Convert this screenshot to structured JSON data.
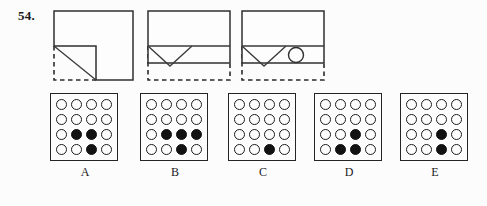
{
  "question": {
    "number": "54."
  },
  "colors": {
    "ink": "#1c1c1c",
    "fill": "#121212",
    "paper": "#fcfcfc",
    "fold_line": "#3a3a3a",
    "dashed_edge": "#2b2b2b"
  },
  "fold_sequence": {
    "name": "paper-folding-sequence",
    "panels": [
      {
        "id": "fold-step-1",
        "description": "square-sheet-bottom-left-corner-folded-up-diagonally",
        "solid_shape": "square",
        "dashed_shape": "original-corner-outline",
        "fold_line": "diagonal"
      },
      {
        "id": "fold-step-2",
        "description": "bottom-edge-folded-up-revealing-v-shaped-flap",
        "solid_shape": "rectangle",
        "dashed_shape": "original-bottom-outline",
        "fold_line": "horizontal-and-v"
      },
      {
        "id": "fold-step-3",
        "description": "hole-punched-through-folded-paper",
        "solid_shape": "rectangle",
        "dashed_shape": "original-bottom-outline",
        "punch": "single-round-hole"
      }
    ]
  },
  "answer_options": [
    {
      "label": "A",
      "name": "option-a",
      "grid": [
        [
          0,
          0,
          0,
          0
        ],
        [
          0,
          0,
          0,
          0
        ],
        [
          0,
          1,
          1,
          0
        ],
        [
          0,
          0,
          1,
          0
        ]
      ]
    },
    {
      "label": "B",
      "name": "option-b",
      "grid": [
        [
          0,
          0,
          0,
          0
        ],
        [
          0,
          0,
          0,
          0
        ],
        [
          0,
          1,
          1,
          1
        ],
        [
          0,
          0,
          1,
          0
        ]
      ]
    },
    {
      "label": "C",
      "name": "option-c",
      "grid": [
        [
          0,
          0,
          0,
          0
        ],
        [
          0,
          0,
          0,
          0
        ],
        [
          0,
          0,
          0,
          0
        ],
        [
          0,
          0,
          1,
          0
        ]
      ]
    },
    {
      "label": "D",
      "name": "option-d",
      "grid": [
        [
          0,
          0,
          0,
          0
        ],
        [
          0,
          0,
          0,
          0
        ],
        [
          0,
          0,
          1,
          0
        ],
        [
          0,
          1,
          1,
          0
        ]
      ]
    },
    {
      "label": "E",
      "name": "option-e",
      "grid": [
        [
          0,
          0,
          0,
          0
        ],
        [
          0,
          0,
          0,
          0
        ],
        [
          0,
          0,
          1,
          0
        ],
        [
          0,
          0,
          1,
          0
        ]
      ]
    }
  ]
}
